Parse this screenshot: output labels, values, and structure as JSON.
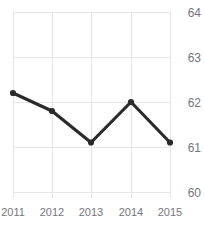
{
  "chart_data": {
    "type": "line",
    "title": "Freedom Trend",
    "xlabel": "",
    "ylabel": "",
    "categories": [
      "2011",
      "2012",
      "2013",
      "2014",
      "2015"
    ],
    "x": [
      2011,
      2012,
      2013,
      2014,
      2015
    ],
    "values": [
      62.2,
      61.8,
      61.1,
      62.0,
      61.1
    ],
    "series": [
      {
        "name": "Freedom Trend",
        "values": [
          62.2,
          61.8,
          61.1,
          62.0,
          61.1
        ]
      }
    ],
    "ylim": [
      60,
      64
    ],
    "yticks": [
      60,
      61,
      62,
      63,
      64
    ],
    "ytick_labels": [
      "60",
      "61",
      "62",
      "63",
      "64"
    ],
    "xtick_labels": [
      "2011",
      "2012",
      "2013",
      "2014",
      "2015"
    ],
    "y_axis_position": "right",
    "grid": true,
    "grid_color": "#e6e6ea",
    "legend": false,
    "legend_position": "none",
    "line_color": "#2b2b2b",
    "marker": "circle",
    "marker_color": "#2b2b2b",
    "tick_label_color": "#76767c",
    "title_color": "#1d1d1d",
    "background": "#ffffff"
  }
}
